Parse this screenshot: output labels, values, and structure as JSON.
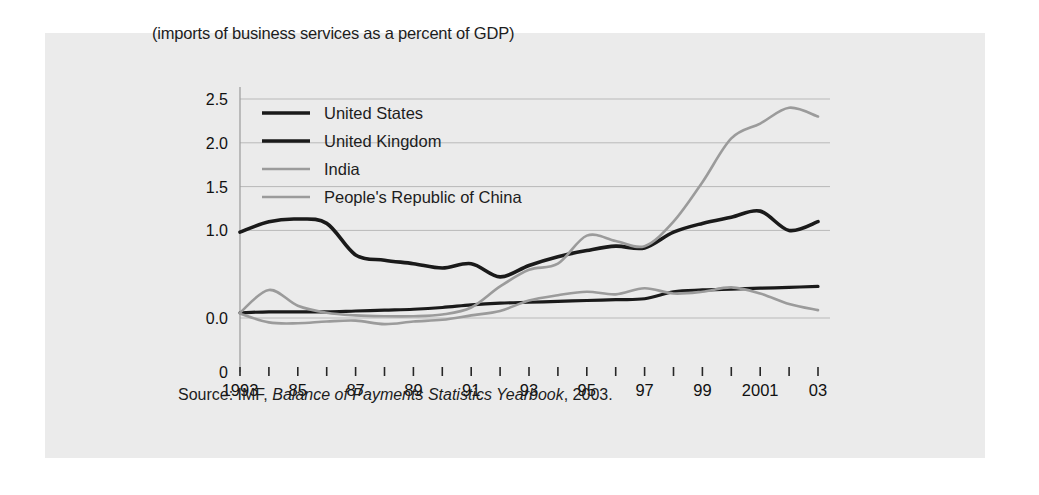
{
  "figure": {
    "title": "(imports of business services as a percent of GDP)",
    "source_prefix": "Source: IMF,",
    "source_italic": "Balance of Payments Statistics Yearbook",
    "source_suffix": ", 2003.",
    "panel_bg": "#ebebeb",
    "page_bg": "#ffffff"
  },
  "chart_data": {
    "type": "line",
    "title": "(imports of business services as a percent of GDP)",
    "xlabel": "",
    "ylabel": "",
    "grid": true,
    "legend_position": "top-left",
    "ylim": [
      0.0,
      2.5
    ],
    "y_ticks": [
      0.0,
      1.0,
      1.5,
      2.0,
      2.5
    ],
    "y_tick_labels": [
      "0.0",
      "1.0",
      "1.5",
      "2.0",
      "2.5"
    ],
    "y_axis_origin_label": "0",
    "x": [
      1993,
      1984,
      1985,
      1986,
      1987,
      1988,
      1989,
      1990,
      1991,
      1992,
      1993,
      1994,
      1995,
      1996,
      1997,
      1998,
      1999,
      2000,
      2001,
      2002,
      2003
    ],
    "x_tick_labels": [
      "1993",
      "",
      "85",
      "",
      "87",
      "",
      "89",
      "",
      "91",
      "",
      "93",
      "",
      "95",
      "",
      "97",
      "",
      "99",
      "",
      "2001",
      "",
      "03"
    ],
    "series": [
      {
        "name": "United States",
        "color": "#1a1a1a",
        "width": 3.2,
        "values": [
          0.06,
          0.07,
          0.07,
          0.07,
          0.08,
          0.09,
          0.1,
          0.12,
          0.15,
          0.17,
          0.18,
          0.19,
          0.2,
          0.21,
          0.22,
          0.3,
          0.32,
          0.33,
          0.34,
          0.35,
          0.36
        ]
      },
      {
        "name": "United  Kingdom",
        "color": "#1a1a1a",
        "width": 3.6,
        "values": [
          0.98,
          1.1,
          1.13,
          1.08,
          0.72,
          0.66,
          0.62,
          0.57,
          0.62,
          0.47,
          0.6,
          0.7,
          0.77,
          0.82,
          0.8,
          0.98,
          1.08,
          1.15,
          1.22,
          1.0,
          1.1
        ]
      },
      {
        "name": "India",
        "color": "#9b9b9b",
        "width": 2.6,
        "values": [
          0.06,
          0.32,
          0.14,
          0.06,
          0.03,
          0.02,
          0.02,
          0.04,
          0.12,
          0.36,
          0.55,
          0.62,
          0.94,
          0.88,
          0.82,
          1.1,
          1.55,
          2.05,
          2.22,
          2.4,
          2.3
        ]
      },
      {
        "name": "People's Republic of China",
        "color": "#9b9b9b",
        "width": 2.6,
        "values": [
          0.05,
          -0.05,
          -0.06,
          -0.04,
          -0.03,
          -0.07,
          -0.04,
          -0.02,
          0.03,
          0.08,
          0.2,
          0.26,
          0.3,
          0.27,
          0.34,
          0.28,
          0.3,
          0.35,
          0.28,
          0.16,
          0.09
        ]
      }
    ]
  },
  "legend": [
    {
      "label": "United States",
      "color": "#1a1a1a",
      "width": 3.6
    },
    {
      "label": "United  Kingdom",
      "color": "#1a1a1a",
      "width": 3.6
    },
    {
      "label": "India",
      "color": "#9b9b9b",
      "width": 2.6
    },
    {
      "label": "People's Republic of China",
      "color": "#9b9b9b",
      "width": 2.6
    }
  ]
}
